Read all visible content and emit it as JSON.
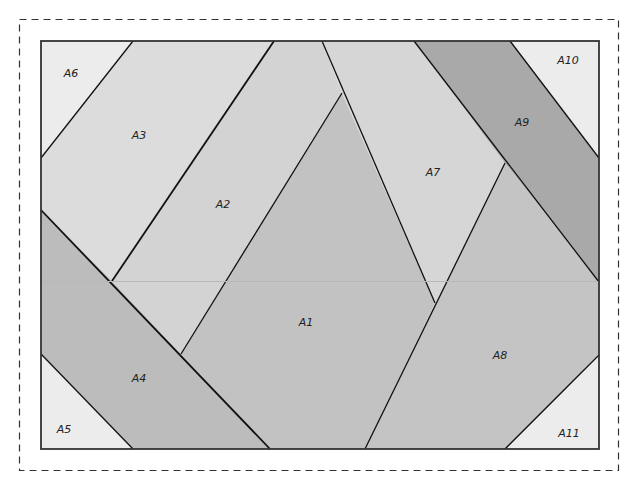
{
  "diagram": {
    "cut_line": {
      "style": "dashed",
      "color": "#333333"
    },
    "frame": {
      "x": 41,
      "y": 41,
      "width": 558,
      "height": 408,
      "stroke": "#333333"
    },
    "pieces": [
      {
        "id": "A1",
        "label": "A1",
        "fill": "#c2c2c2",
        "points": "342,93 435,303 365,449 270,449 181,354",
        "label_pos": [
          306,
          326
        ]
      },
      {
        "id": "A2",
        "label": "A2",
        "fill": "#d3d3d3",
        "points": "274,41 322,41 342,93 181,354 112,281",
        "label_pos": [
          223,
          208
        ]
      },
      {
        "id": "A3",
        "label": "A3",
        "fill": "#dcdcdc",
        "points": "133,41 274,41 112,281 41,210 41,158",
        "label_pos": [
          139,
          139
        ]
      },
      {
        "id": "A4",
        "label": "A4",
        "fill": "#bcbcbc",
        "points": "41,210 112,281 181,354 270,449 133,449 41,354",
        "label_pos": [
          139,
          382
        ]
      },
      {
        "id": "A5",
        "label": "A5",
        "fill": "#ececec",
        "points": "41,354 133,449 41,449",
        "label_pos": [
          64,
          433
        ]
      },
      {
        "id": "A6",
        "label": "A6",
        "fill": "#ececec",
        "points": "41,41 133,41 41,158",
        "label_pos": [
          71,
          77
        ]
      },
      {
        "id": "A7",
        "label": "A7",
        "fill": "#d6d6d6",
        "points": "322,41 414,41 505,163 435,303 342,93",
        "label_pos": [
          433,
          176
        ]
      },
      {
        "id": "A8",
        "label": "A8",
        "fill": "#c4c4c4",
        "points": "505,163 599,282 599,355 505,449 365,449 435,303",
        "label_pos": [
          500,
          359
        ]
      },
      {
        "id": "A9",
        "label": "A9",
        "fill": "#a9a9a9",
        "points": "414,41 510,41 599,158 599,282 505,163",
        "label_pos": [
          522,
          126
        ]
      },
      {
        "id": "A10",
        "label": "A10",
        "fill": "#ececec",
        "points": "510,41 599,41 599,158",
        "label_pos": [
          568,
          64
        ]
      },
      {
        "id": "A11",
        "label": "A11",
        "fill": "#ececec",
        "points": "599,355 599,449 505,449",
        "label_pos": [
          569,
          437
        ]
      }
    ],
    "seams": [
      {
        "from": [
          133,
          41
        ],
        "to": [
          41,
          158
        ],
        "weight": "normal"
      },
      {
        "from": [
          274,
          41
        ],
        "to": [
          112,
          281
        ],
        "weight": "thick"
      },
      {
        "from": [
          41,
          210
        ],
        "to": [
          270,
          449
        ],
        "weight": "thick"
      },
      {
        "from": [
          41,
          354
        ],
        "to": [
          133,
          449
        ],
        "weight": "normal"
      },
      {
        "from": [
          322,
          41
        ],
        "to": [
          435,
          303
        ],
        "weight": "normal"
      },
      {
        "from": [
          342,
          93
        ],
        "to": [
          181,
          354
        ],
        "weight": "normal"
      },
      {
        "from": [
          505,
          163
        ],
        "to": [
          365,
          449
        ],
        "weight": "normal"
      },
      {
        "from": [
          414,
          41
        ],
        "to": [
          599,
          282
        ],
        "weight": "normal"
      },
      {
        "from": [
          510,
          41
        ],
        "to": [
          599,
          158
        ],
        "weight": "normal"
      },
      {
        "from": [
          599,
          355
        ],
        "to": [
          505,
          449
        ],
        "weight": "normal"
      }
    ]
  }
}
